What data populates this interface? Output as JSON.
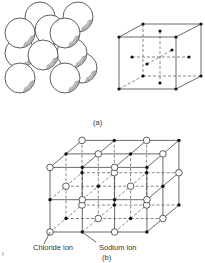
{
  "figure": {
    "part_a": {
      "caption": "(a)",
      "description": "Face-centred cubic packing of spheres and its lattice-point cube"
    },
    "part_b": {
      "caption": "(b)",
      "description": "Sodium chloride crystal lattice",
      "legend": {
        "chloride_label": "Chloride ion",
        "sodium_label": "Sodium ion"
      }
    },
    "margin_mark": "f"
  },
  "colors": {
    "line": "#444444",
    "solid_ion": "#111111",
    "open_ion_fill": "#ffffff"
  }
}
